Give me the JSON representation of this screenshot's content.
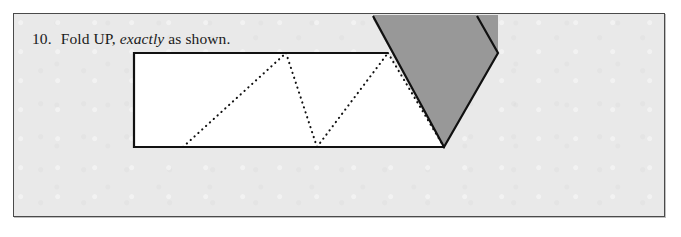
{
  "page": {
    "background_color": "#ffffff",
    "panel_background_color": "#e9e9e9",
    "panel_border_color": "#4a4a4a"
  },
  "caption": {
    "number": "10.",
    "text_before_emphasis": "Fold UP,",
    "emphasized_word": "exactly",
    "text_after_emphasis": "as shown."
  },
  "diagram": {
    "name": "fold-up-paper-diagram",
    "colors": {
      "paper_face": "#ffffff",
      "folded_flap_face": "#989898",
      "ink": "#111111"
    },
    "paper_strip": {
      "label": "paper-strip",
      "points": "120,39 374,39 430,133 120,133"
    },
    "folded_flap": {
      "label": "folded-flap",
      "points": "359,1 484,1 484,39 430,133 359,5"
    },
    "flap_outline": {
      "label": "folded-flap-outline",
      "points": "359,2 430,133 484,39 463,2"
    },
    "strip_outline_left": {
      "label": "paper-strip-outline",
      "points": "374,39 120,39 120,133 430,133"
    },
    "fold_lines": [
      {
        "label": "fold-line-1",
        "points": "169,133 272,39"
      },
      {
        "label": "fold-line-2",
        "points": "272,39 303,133"
      },
      {
        "label": "fold-line-3",
        "points": "303,133 374,39"
      },
      {
        "label": "fold-line-4",
        "points": "374,39 430,133"
      }
    ]
  }
}
